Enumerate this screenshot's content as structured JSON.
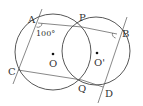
{
  "diagram": {
    "type": "geometry",
    "circles": [
      {
        "name": "O",
        "label": "O",
        "cx": 53,
        "cy": 52,
        "r": 38
      },
      {
        "name": "O'",
        "label": "O'",
        "cx": 96,
        "cy": 51,
        "r": 34
      }
    ],
    "points": {
      "A": {
        "label": "A",
        "x": 38,
        "y": 23
      },
      "P": {
        "label": "P",
        "x": 82,
        "y": 27
      },
      "B": {
        "label": "B",
        "x": 117,
        "y": 34
      },
      "C": {
        "label": "C",
        "x": 18,
        "y": 70
      },
      "Q": {
        "label": "Q",
        "x": 82,
        "y": 80
      },
      "D": {
        "label": "D",
        "x": 103,
        "y": 87
      }
    },
    "angle_label": "100°",
    "segments": [
      "AP",
      "PB",
      "CQ",
      "QD",
      "PQ"
    ],
    "lines": [
      "AC (extended)",
      "BD (extended)"
    ],
    "angle_marks": [
      "angle CAP at A",
      "angle PBD at B"
    ]
  }
}
